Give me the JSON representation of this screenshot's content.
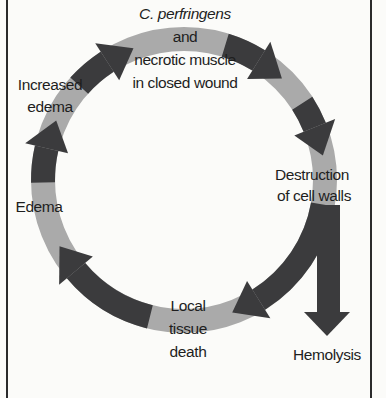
{
  "colors": {
    "background": "#fbfbf9",
    "ring_light": "#aaaaaa",
    "arrow_dark": "#3b3b3d",
    "text": "#1e1e1e",
    "border": "#2b2b2b"
  },
  "ring": {
    "cx": 184,
    "cy": 180,
    "r": 141,
    "width": 24
  },
  "arrows": [
    {
      "name": "arrow-edema-to-increased-edema",
      "start": 179,
      "end": 193
    },
    {
      "name": "arrow-increased-edema-to-top",
      "start": 222,
      "end": 237
    },
    {
      "name": "arrow-top-to-right",
      "start": 287,
      "end": 302
    },
    {
      "name": "arrow-right-to-destruction",
      "start": 327,
      "end": 338
    },
    {
      "name": "arrow-destruction-to-tissue-death",
      "start": 10,
      "end": 58
    },
    {
      "name": "arrow-tissue-death-to-edema",
      "start": 104,
      "end": 140
    }
  ],
  "hemolysis_arrow": {
    "x1": 317,
    "x2": 340,
    "top": 205,
    "head_y": 312,
    "head_x1": 304,
    "head_x2": 350,
    "tip_y": 336
  },
  "labels": {
    "start_species": "C. perfringens",
    "start_and": "and",
    "start_line2": "necrotic muscle",
    "start_line3": "in closed wound",
    "destruction_line1": "Destruction",
    "destruction_line2": "of cell walls",
    "tissue_line1": "Local",
    "tissue_line2": "tissue",
    "tissue_line3": "death",
    "edema": "Edema",
    "increased_line1": "Increased",
    "increased_line2": "edema",
    "hemolysis": "Hemolysis"
  }
}
